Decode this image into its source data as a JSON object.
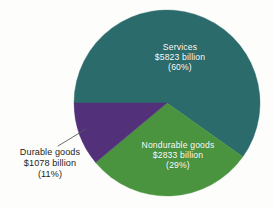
{
  "chart_data": {
    "type": "pie",
    "title": "",
    "subtitle": "",
    "xlabel": "",
    "ylabel": "",
    "legend_position": "none",
    "grid": false,
    "units": "billions of dollars",
    "total_label": "",
    "categories": [
      "Services",
      "Nondurable goods",
      "Durable goods"
    ],
    "values": [
      5823,
      2833,
      1078
    ],
    "percentages": [
      60,
      29,
      11
    ],
    "colors": [
      "#2b6b6b",
      "#4a9440",
      "#52307a"
    ],
    "start_angle_deg": 180,
    "direction": "clockwise",
    "slices": [
      {
        "name": "Services",
        "value": 5823,
        "value_label": "$5823 billion",
        "percent": 60,
        "percent_label": "(60%)",
        "color": "#2b6b6b",
        "label_color": "#ffffff",
        "label_placement": "inside"
      },
      {
        "name": "Nondurable goods",
        "value": 2833,
        "value_label": "$2833 billion",
        "percent": 29,
        "percent_label": "(29%)",
        "color": "#4a9440",
        "label_color": "#ffffff",
        "label_placement": "inside"
      },
      {
        "name": "Durable goods",
        "value": 1078,
        "value_label": "$1078 billion",
        "percent": 11,
        "percent_label": "(11%)",
        "color": "#52307a",
        "label_color": "#231f20",
        "label_placement": "outside-left-callout"
      }
    ]
  },
  "figure": {
    "background_color": "#fdfdfb",
    "center_x": 167,
    "center_y": 103,
    "radius": 93,
    "leader_line_color": "#5a5a5a"
  }
}
